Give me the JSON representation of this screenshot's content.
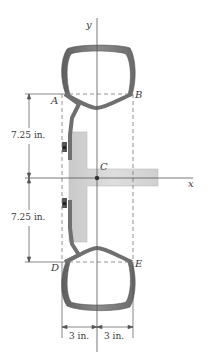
{
  "figure": {
    "axes": {
      "y_label": "y",
      "x_label": "x"
    },
    "points": {
      "A": "A",
      "B": "B",
      "C": "C",
      "D": "D",
      "E": "E"
    },
    "dimensions": {
      "upper_vertical": "7.25 in.",
      "lower_vertical": "7.25 in.",
      "left_horizontal": "3 in.",
      "right_horizontal": "3 in."
    },
    "colors": {
      "structure": "#6f6f6f",
      "tbar_fill": "#d4d4d4",
      "line": "#555555",
      "dashed": "#777777"
    }
  }
}
